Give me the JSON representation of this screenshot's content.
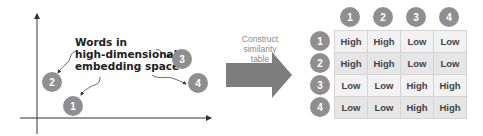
{
  "embedding_space": {
    "label_lines": [
      "Words in",
      "high-dimensional",
      "embedding space"
    ],
    "points": [
      {
        "id": "1",
        "x": 63,
        "y": 96
      },
      {
        "id": "2",
        "x": 42,
        "y": 72
      },
      {
        "id": "3",
        "x": 172,
        "y": 49
      },
      {
        "id": "4",
        "x": 188,
        "y": 73
      }
    ]
  },
  "transition": {
    "label_lines": [
      "Construct",
      "similarity",
      "table"
    ],
    "arrow_color": "#7d7d7d"
  },
  "similarity_table": {
    "column_headers": [
      "1",
      "2",
      "3",
      "4"
    ],
    "row_headers": [
      "1",
      "2",
      "3",
      "4"
    ],
    "rows": [
      [
        "High",
        "High",
        "Low",
        "Low"
      ],
      [
        "High",
        "High",
        "Low",
        "Low"
      ],
      [
        "Low",
        "Low",
        "High",
        "High"
      ],
      [
        "Low",
        "Low",
        "High",
        "High"
      ]
    ]
  },
  "colors": {
    "circle": "#8f8f8f",
    "cell_light": "#f2f2f2",
    "cell_dark": "#e6e6e6"
  }
}
